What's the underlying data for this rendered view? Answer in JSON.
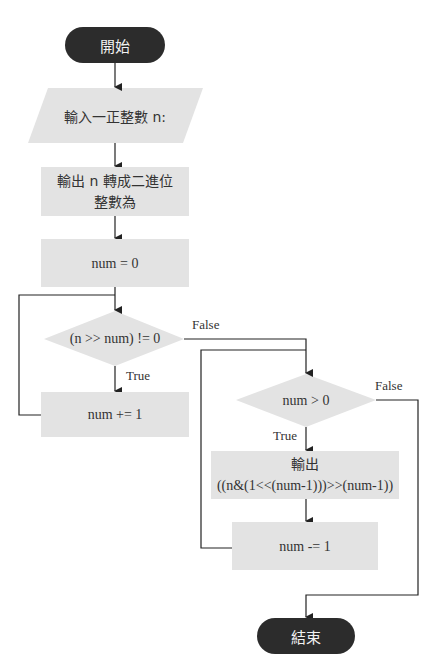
{
  "flowchart": {
    "start": "開始",
    "input": "輸入一正整數 n:",
    "output_intro_line1": "輸出 n 轉成二進位",
    "output_intro_line2": "整數為",
    "init": "num = 0",
    "cond1": "(n >> num) != 0",
    "cond1_true": "True",
    "cond1_false": "False",
    "increment": "num += 1",
    "cond2": "num > 0",
    "cond2_true": "True",
    "cond2_false": "False",
    "output_bit_line1": "輸出",
    "output_bit_line2": "((n&(1<<(num-1)))>>(num-1))",
    "decrement": "num -= 1",
    "end": "結束"
  },
  "colors": {
    "terminal_fill": "#2c2c2c",
    "process_fill": "#e3e3e3",
    "line": "#222222"
  }
}
